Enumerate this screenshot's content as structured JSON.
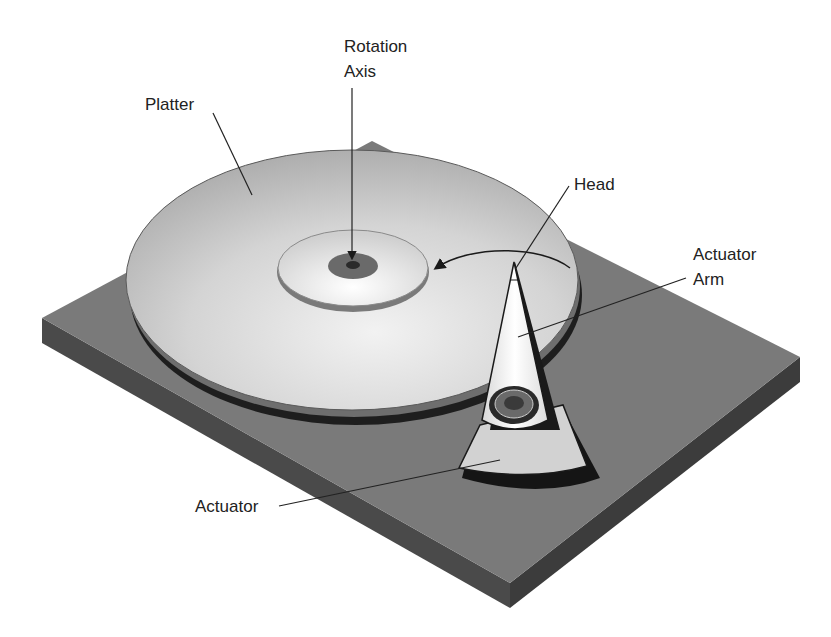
{
  "diagram": {
    "labels": {
      "rotation_axis_line1": "Rotation",
      "rotation_axis_line2": "Axis",
      "platter": "Platter",
      "head": "Head",
      "actuator_arm_line1": "Actuator",
      "actuator_arm_line2": "Arm",
      "actuator": "Actuator"
    },
    "colors": {
      "background": "#ffffff",
      "base_top": "#7a7a7a",
      "base_side": "#4a4a4a",
      "platter_top": "#c8c8c8",
      "platter_edge": "#1e1e1e",
      "hub": "#e2e2e2",
      "spindle": "#6a6a6a",
      "arm": "#f0f0f0",
      "outline": "#1a1a1a",
      "text": "#222222"
    }
  }
}
